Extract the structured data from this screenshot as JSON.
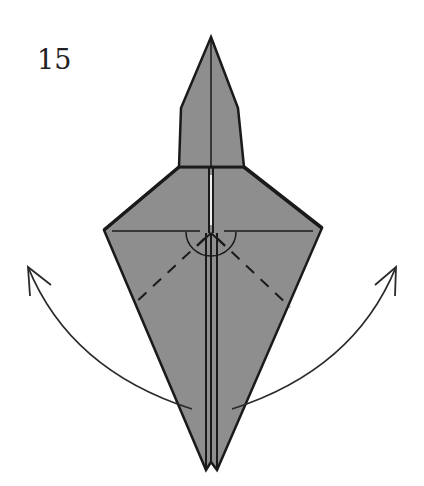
{
  "diagram": {
    "step_number": "15",
    "paper_color": "#8e8e8e",
    "line_color": "#1a1a1a",
    "elements": {
      "model": "origami kite-shaped base with pointed head",
      "valley_fold_lines": 2,
      "fold_arrows": [
        "left-arrow-up",
        "right-arrow-up"
      ],
      "angle_marks": "semicircle at center vertex"
    }
  }
}
